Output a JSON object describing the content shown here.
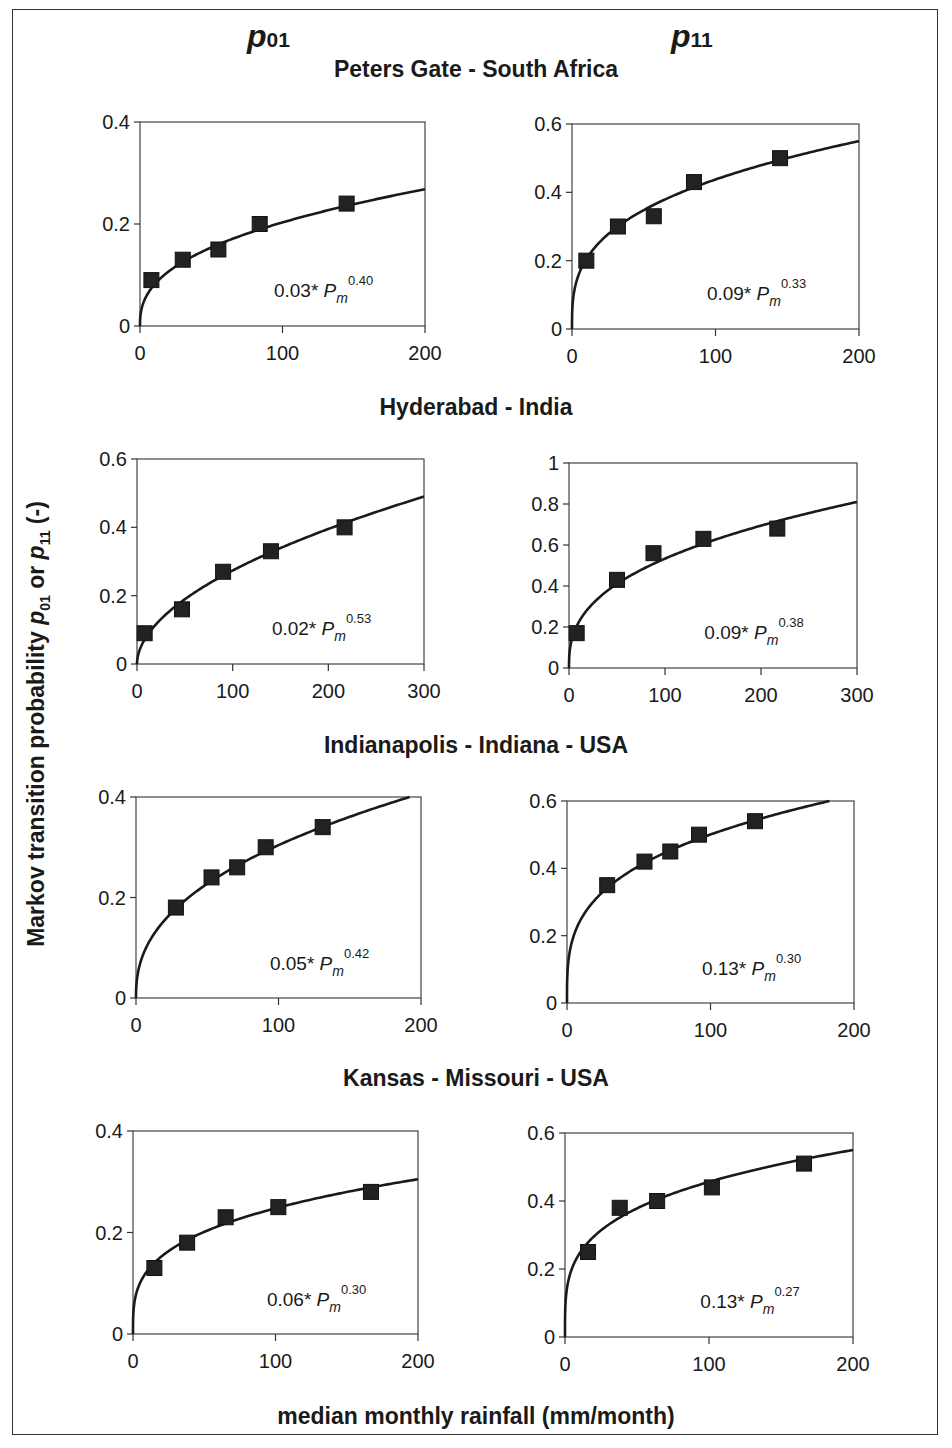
{
  "figure": {
    "column_headers": [
      {
        "symbol": "p",
        "subscript": "01"
      },
      {
        "symbol": "p",
        "subscript": "11"
      }
    ],
    "y_axis_label": {
      "prefix": "Markov transition probability ",
      "p01": "p",
      "p01_sub": "01",
      "mid": " or ",
      "p11": "p",
      "p11_sub": "11",
      "suffix": " (-)"
    },
    "x_axis_label": "median monthly rainfall (mm/month)",
    "sites": [
      "Peters Gate - South Africa",
      "Hyderabad - India",
      "Indianapolis - Indiana - USA",
      "Kansas - Missouri - USA"
    ]
  },
  "chart_data": [
    {
      "type": "scatter",
      "title": "Peters Gate - South Africa",
      "panel": "p01",
      "xlabel": "median monthly rainfall (mm/month)",
      "ylabel": "Markov transition probability p01 (-)",
      "xlim": [
        0,
        200
      ],
      "ylim": [
        0,
        0.4
      ],
      "xticks": [
        0,
        100,
        200
      ],
      "yticks": [
        0,
        0.2,
        0.4
      ],
      "ytick_labels": [
        "0",
        "0.2",
        "0.4"
      ],
      "points": {
        "x": [
          8,
          30,
          55,
          84,
          145
        ],
        "y": [
          0.09,
          0.13,
          0.15,
          0.2,
          0.24
        ]
      },
      "fit": {
        "label_coef": "0.03*",
        "label_var": "P",
        "label_sub": "m",
        "label_exp": "0.40",
        "a": 0.03,
        "b": 0.4,
        "end_y": 0.268
      },
      "grid": false
    },
    {
      "type": "scatter",
      "title": "Peters Gate - South Africa",
      "panel": "p11",
      "xlabel": "median monthly rainfall (mm/month)",
      "ylabel": "Markov transition probability p11 (-)",
      "xlim": [
        0,
        200
      ],
      "ylim": [
        0,
        0.6
      ],
      "xticks": [
        0,
        100,
        200
      ],
      "yticks": [
        0,
        0.2,
        0.4,
        0.6
      ],
      "ytick_labels": [
        "0",
        "0.2",
        "0.4",
        "0.6"
      ],
      "points": {
        "x": [
          10,
          32,
          57,
          85,
          145
        ],
        "y": [
          0.2,
          0.3,
          0.33,
          0.43,
          0.5
        ]
      },
      "fit": {
        "label_coef": "0.09*",
        "label_var": "P",
        "label_sub": "m",
        "label_exp": "0.33",
        "a": 0.09,
        "b": 0.33,
        "end_y": 0.55
      },
      "grid": false
    },
    {
      "type": "scatter",
      "title": "Hyderabad - India",
      "panel": "p01",
      "xlabel": "median monthly rainfall (mm/month)",
      "ylabel": "Markov transition probability p01 (-)",
      "xlim": [
        0,
        300
      ],
      "ylim": [
        0,
        0.6
      ],
      "xticks": [
        0,
        100,
        200,
        300
      ],
      "yticks": [
        0,
        0.2,
        0.4,
        0.6
      ],
      "ytick_labels": [
        "0",
        "0.2",
        "0.4",
        "0.6"
      ],
      "points": {
        "x": [
          8,
          47,
          90,
          140,
          217
        ],
        "y": [
          0.09,
          0.16,
          0.27,
          0.33,
          0.4
        ]
      },
      "fit": {
        "label_coef": "0.02*",
        "label_var": "P",
        "label_sub": "m",
        "label_exp": "0.53",
        "a": 0.02,
        "b": 0.53,
        "end_y": 0.49
      },
      "grid": false
    },
    {
      "type": "scatter",
      "title": "Hyderabad - India",
      "panel": "p11",
      "xlabel": "median monthly rainfall (mm/month)",
      "ylabel": "Markov transition probability p11 (-)",
      "xlim": [
        0,
        300
      ],
      "ylim": [
        0,
        1
      ],
      "xticks": [
        0,
        100,
        200,
        300
      ],
      "yticks": [
        0,
        0.2,
        0.4,
        0.6,
        0.8,
        1
      ],
      "ytick_labels": [
        "0",
        "0.2",
        "0.4",
        "0.6",
        "0.8",
        "1"
      ],
      "points": {
        "x": [
          8,
          50,
          88,
          140,
          217
        ],
        "y": [
          0.17,
          0.43,
          0.56,
          0.63,
          0.68
        ]
      },
      "fit": {
        "label_coef": "0.09*",
        "label_var": "P",
        "label_sub": "m",
        "label_exp": "0.38",
        "a": 0.09,
        "b": 0.38,
        "end_y": 0.81
      },
      "grid": false
    },
    {
      "type": "scatter",
      "title": "Indianapolis - Indiana - USA",
      "panel": "p01",
      "xlabel": "median monthly rainfall (mm/month)",
      "ylabel": "Markov transition probability p01 (-)",
      "xlim": [
        0,
        200
      ],
      "ylim": [
        0,
        0.4
      ],
      "xticks": [
        0,
        100,
        200
      ],
      "yticks": [
        0,
        0.2,
        0.4
      ],
      "ytick_labels": [
        "0",
        "0.2",
        "0.4"
      ],
      "points": {
        "x": [
          28,
          53,
          71,
          91,
          131
        ],
        "y": [
          0.18,
          0.24,
          0.26,
          0.3,
          0.34
        ]
      },
      "fit": {
        "label_coef": "0.05*",
        "label_var": "P",
        "label_sub": "m",
        "label_exp": "0.42",
        "a": 0.05,
        "b": 0.42,
        "end_y": 0.4,
        "end_x": 192
      },
      "grid": false
    },
    {
      "type": "scatter",
      "title": "Indianapolis - Indiana - USA",
      "panel": "p11",
      "xlabel": "median monthly rainfall (mm/month)",
      "ylabel": "Markov transition probability p11 (-)",
      "xlim": [
        0,
        200
      ],
      "ylim": [
        0,
        0.6
      ],
      "xticks": [
        0,
        100,
        200
      ],
      "yticks": [
        0,
        0.2,
        0.4,
        0.6
      ],
      "ytick_labels": [
        "0",
        "0.2",
        "0.4",
        "0.6"
      ],
      "points": {
        "x": [
          28,
          54,
          72,
          92,
          131
        ],
        "y": [
          0.35,
          0.42,
          0.45,
          0.5,
          0.54
        ]
      },
      "fit": {
        "label_coef": "0.13*",
        "label_var": "P",
        "label_sub": "m",
        "label_exp": "0.30",
        "a": 0.13,
        "b": 0.3,
        "end_y": 0.6,
        "end_x": 183
      },
      "grid": false
    },
    {
      "type": "scatter",
      "title": "Kansas - Missouri - USA",
      "panel": "p01",
      "xlabel": "median monthly rainfall (mm/month)",
      "ylabel": "Markov transition probability p01 (-)",
      "xlim": [
        0,
        200
      ],
      "ylim": [
        0,
        0.4
      ],
      "xticks": [
        0,
        100,
        200
      ],
      "yticks": [
        0,
        0.2,
        0.4
      ],
      "ytick_labels": [
        "0",
        "0.2",
        "0.4"
      ],
      "points": {
        "x": [
          15,
          38,
          65,
          102,
          167
        ],
        "y": [
          0.13,
          0.18,
          0.23,
          0.25,
          0.28
        ]
      },
      "fit": {
        "label_coef": "0.06*",
        "label_var": "P",
        "label_sub": "m",
        "label_exp": "0.30",
        "a": 0.06,
        "b": 0.3,
        "end_y": 0.305
      },
      "grid": false
    },
    {
      "type": "scatter",
      "title": "Kansas - Missouri - USA",
      "panel": "p11",
      "xlabel": "median monthly rainfall (mm/month)",
      "ylabel": "Markov transition probability p11 (-)",
      "xlim": [
        0,
        200
      ],
      "ylim": [
        0,
        0.6
      ],
      "xticks": [
        0,
        100,
        200
      ],
      "yticks": [
        0,
        0.2,
        0.4,
        0.6
      ],
      "ytick_labels": [
        "0",
        "0.2",
        "0.4",
        "0.6"
      ],
      "points": {
        "x": [
          16,
          38,
          64,
          102,
          166
        ],
        "y": [
          0.25,
          0.38,
          0.4,
          0.44,
          0.51
        ]
      },
      "fit": {
        "label_coef": "0.13*",
        "label_var": "P",
        "label_sub": "m",
        "label_exp": "0.27",
        "a": 0.13,
        "b": 0.27,
        "end_y": 0.55
      },
      "grid": false
    }
  ],
  "layout": {
    "panels_px": [
      {
        "l": 140,
        "r": 425,
        "t": 122,
        "b": 326
      },
      {
        "l": 572,
        "r": 859,
        "t": 124,
        "b": 329
      },
      {
        "l": 137,
        "r": 424,
        "t": 459,
        "b": 664
      },
      {
        "l": 569,
        "r": 857,
        "t": 463,
        "b": 668
      },
      {
        "l": 136,
        "r": 421,
        "t": 797,
        "b": 998
      },
      {
        "l": 567,
        "r": 854,
        "t": 801,
        "b": 1003
      },
      {
        "l": 133,
        "r": 418,
        "t": 1131,
        "b": 1334
      },
      {
        "l": 565,
        "r": 853,
        "t": 1133,
        "b": 1337
      }
    ],
    "site_title_tops": [
      55,
      393,
      731,
      1064
    ],
    "col_head_lefts": [
      247,
      671
    ]
  },
  "colors": {
    "ink": "#1a1a1a",
    "frame": "#333333",
    "background": "#ffffff"
  }
}
